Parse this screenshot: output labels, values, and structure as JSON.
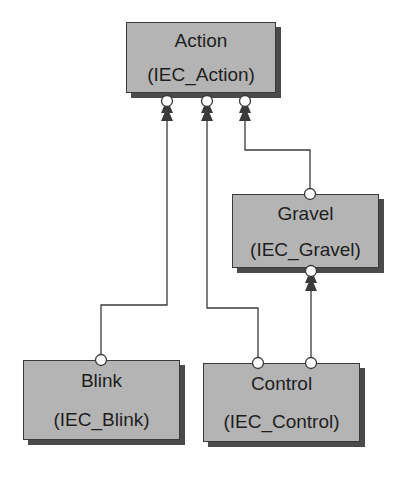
{
  "diagram": {
    "nodes": [
      {
        "id": "action",
        "name": "Action",
        "type": "(IEC_Action)"
      },
      {
        "id": "gravel",
        "name": "Gravel",
        "type": "(IEC_Gravel)"
      },
      {
        "id": "blink",
        "name": "Blink",
        "type": "(IEC_Blink)"
      },
      {
        "id": "control",
        "name": "Control",
        "type": "(IEC_Control)"
      }
    ],
    "edges": [
      {
        "from": "blink",
        "to": "action"
      },
      {
        "from": "control",
        "to": "action"
      },
      {
        "from": "gravel",
        "to": "action"
      },
      {
        "from": "control",
        "to": "gravel"
      }
    ],
    "colors": {
      "box_fill": "#b4b4b4",
      "shadow": "#4a4a4a",
      "line": "#3a3a3a",
      "port": "#ffffff"
    }
  }
}
